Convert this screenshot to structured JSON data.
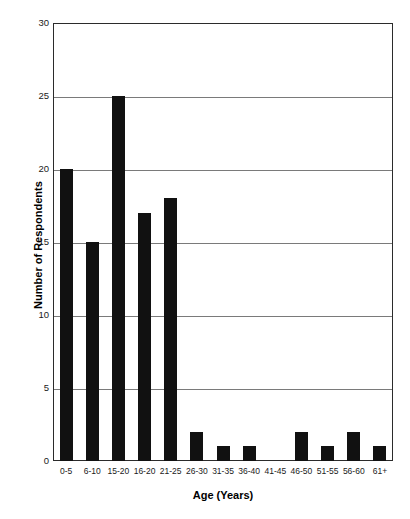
{
  "chart_data": {
    "type": "bar",
    "title": "",
    "xlabel": "Age (Years)",
    "ylabel": "Number of Respondents",
    "categories": [
      "0-5",
      "6-10",
      "15-20",
      "16-20",
      "21-25",
      "26-30",
      "31-35",
      "36-40",
      "41-45",
      "46-50",
      "51-55",
      "56-60",
      "61+"
    ],
    "values": [
      20,
      15,
      25,
      17,
      18,
      2,
      1,
      1,
      0,
      2,
      1,
      2,
      1
    ],
    "ylim": [
      0,
      30
    ],
    "ytick_labels": [
      "0",
      "5",
      "10",
      "15",
      "20",
      "25",
      "30"
    ],
    "ytick_values": [
      0,
      5,
      10,
      15,
      20,
      25,
      30
    ],
    "grid": true,
    "legend": "none",
    "bar_color": "#111111",
    "gridline_color": "#7a7a7a",
    "axis_color": "#2b2b2b",
    "background_color": "#ffffff"
  }
}
